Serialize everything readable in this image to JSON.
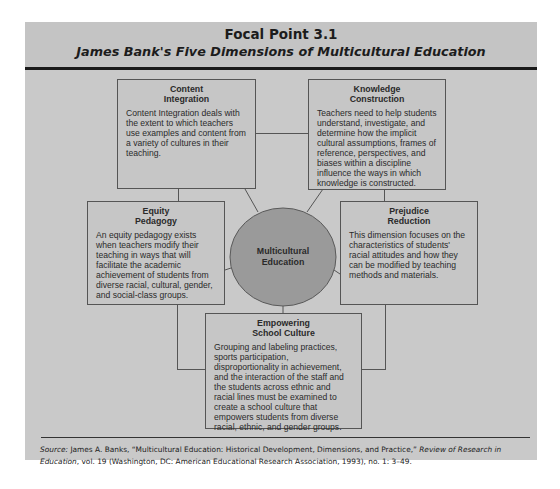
{
  "header": {
    "title": "Focal Point 3.1",
    "subtitle": "James Bank's Five Dimensions of Multicultural Education"
  },
  "hub": {
    "line1": "Multicultural",
    "line2": "Education",
    "fill_color": "#9a9a9a"
  },
  "dimensions": [
    {
      "title_line1": "Content",
      "title_line2": "Integration",
      "body": "Content Integration deals with the extent to which teachers use examples and content from a variety of cultures in their teaching."
    },
    {
      "title_line1": "Knowledge",
      "title_line2": "Construction",
      "body": "Teachers need to help students understand, investigate, and determine how the implicit cultural assumptions, frames of reference, perspectives, and biases within a discipline influence the ways in which knowledge is constructed."
    },
    {
      "title_line1": "Equity",
      "title_line2": "Pedagogy",
      "body": "An equity pedagogy exists when teachers modify their teaching in ways that will facilitate the academic achievement of students from diverse racial, cultural, gender, and social-class groups."
    },
    {
      "title_line1": "Prejudice",
      "title_line2": "Reduction",
      "body": "This dimension focuses on the characteristics of students' racial attitudes and how they can be modified by teaching methods and materials."
    },
    {
      "title_line1": "Empowering",
      "title_line2": "School Culture",
      "body": "Grouping and labeling practices, sports participation, disproportionality in achievement, and the interaction of the staff and the students across ethnic and racial lines must be examined to create a school culture that empowers students from diverse racial, ethnic, and gender groups."
    }
  ],
  "source": {
    "label": "Source:",
    "author_title": " James A. Banks, “Multicultural Education: Historical Development, Dimensions, and Practice,” ",
    "journal": "Review of Research in Education",
    "details": ", vol. 19 (Washington, DC: American Educational Research Association, 1993), no. 1: 3–49."
  },
  "colors": {
    "panel": "#c9c9c9",
    "box_border": "#555555",
    "rule": "#1a1a1a"
  }
}
